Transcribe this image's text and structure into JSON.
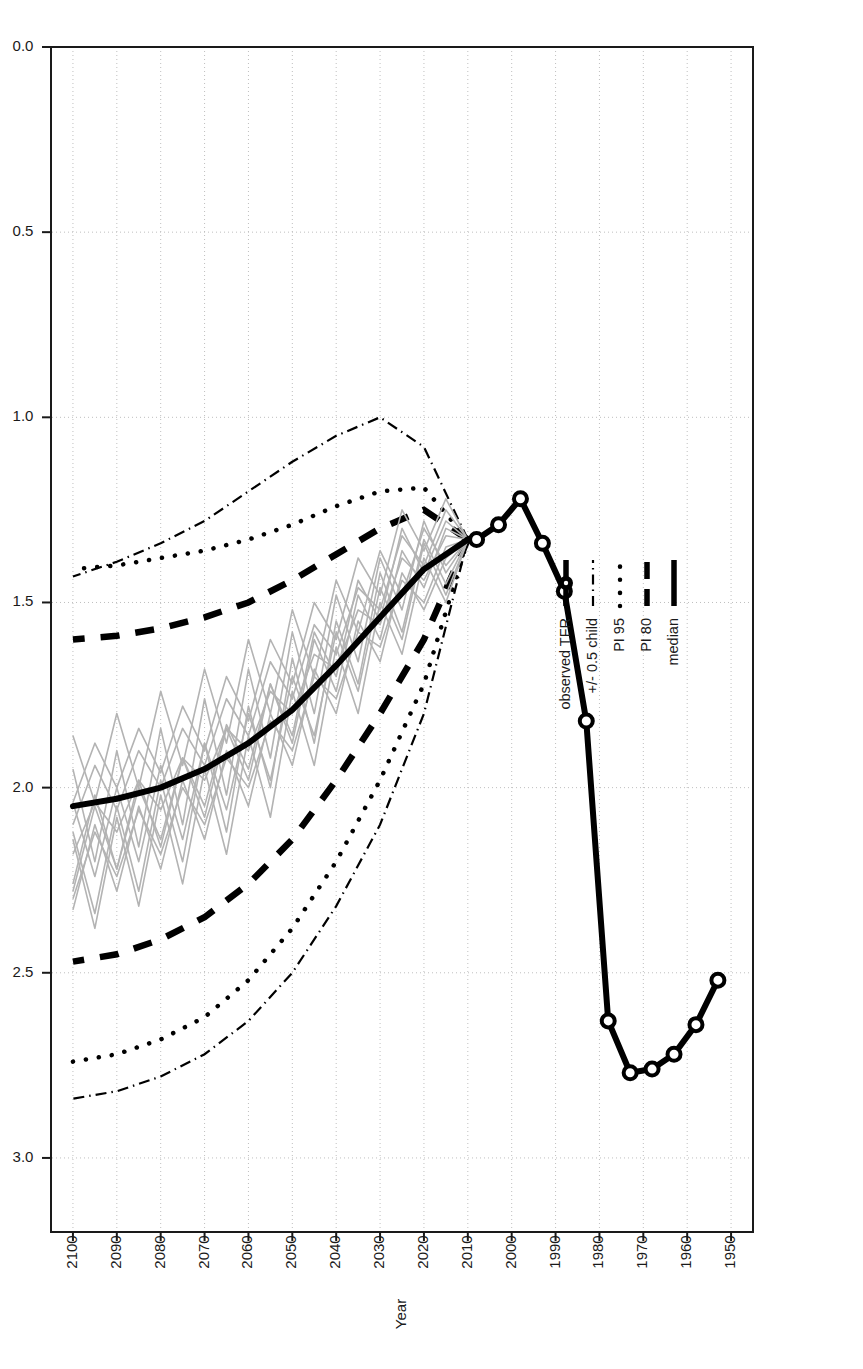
{
  "chart_data": {
    "type": "line",
    "title": "",
    "xlabel": "Year",
    "ylabel": "TFR",
    "xlim": [
      1945,
      2105
    ],
    "ylim": [
      0.0,
      3.2
    ],
    "xticks": [
      1950,
      1960,
      1970,
      1980,
      1990,
      2000,
      2010,
      2020,
      2030,
      2040,
      2050,
      2060,
      2070,
      2080,
      2090,
      2100
    ],
    "yticks": [
      "0.0",
      "0.5",
      "1.0",
      "1.5",
      "2.0",
      "2.5",
      "3.0"
    ],
    "grid": true,
    "legend_position": "bottom-left",
    "legend": [
      {
        "label": "median",
        "style": "solid-thick"
      },
      {
        "label": "PI 80",
        "style": "dashed-thick"
      },
      {
        "label": "PI 95",
        "style": "dotted"
      },
      {
        "label": "+/- 0.5 child",
        "style": "dash-dot"
      },
      {
        "label": "observed TFR",
        "style": "line-with-open-circles"
      }
    ],
    "series": [
      {
        "name": "observed TFR",
        "x": [
          1953,
          1958,
          1963,
          1968,
          1973,
          1978,
          1983,
          1988,
          1993,
          1998,
          2003,
          2008
        ],
        "values": [
          2.52,
          2.64,
          2.72,
          2.76,
          2.77,
          2.63,
          1.82,
          1.47,
          1.34,
          1.22,
          1.29,
          1.33
        ]
      },
      {
        "name": "median",
        "x": [
          2010,
          2020,
          2030,
          2040,
          2050,
          2060,
          2070,
          2080,
          2090,
          2100
        ],
        "values": [
          1.33,
          1.41,
          1.54,
          1.67,
          1.79,
          1.88,
          1.95,
          2.0,
          2.03,
          2.05
        ]
      },
      {
        "name": "PI 80 lower",
        "x": [
          2010,
          2020,
          2030,
          2040,
          2050,
          2060,
          2070,
          2080,
          2090,
          2100
        ],
        "values": [
          1.33,
          1.25,
          1.3,
          1.37,
          1.44,
          1.5,
          1.54,
          1.57,
          1.59,
          1.6
        ]
      },
      {
        "name": "PI 80 upper",
        "x": [
          2010,
          2020,
          2030,
          2040,
          2050,
          2060,
          2070,
          2080,
          2090,
          2100
        ],
        "values": [
          1.33,
          1.6,
          1.8,
          1.98,
          2.14,
          2.26,
          2.35,
          2.41,
          2.45,
          2.47
        ]
      },
      {
        "name": "PI 95 lower",
        "x": [
          2010,
          2020,
          2030,
          2040,
          2050,
          2060,
          2070,
          2080,
          2090,
          2100
        ],
        "values": [
          1.33,
          1.19,
          1.2,
          1.24,
          1.29,
          1.33,
          1.36,
          1.38,
          1.4,
          1.41
        ]
      },
      {
        "name": "PI 95 upper",
        "x": [
          2010,
          2020,
          2030,
          2040,
          2050,
          2060,
          2070,
          2080,
          2090,
          2100
        ],
        "values": [
          1.33,
          1.72,
          1.98,
          2.2,
          2.38,
          2.52,
          2.62,
          2.68,
          2.72,
          2.74
        ]
      },
      {
        "name": "+/- 0.5 child lower",
        "x": [
          2010,
          2020,
          2030,
          2040,
          2050,
          2060,
          2070,
          2080,
          2090,
          2100
        ],
        "values": [
          1.33,
          1.08,
          1.0,
          1.05,
          1.12,
          1.2,
          1.28,
          1.34,
          1.39,
          1.43
        ]
      },
      {
        "name": "+/- 0.5 child upper",
        "x": [
          2010,
          2020,
          2030,
          2040,
          2050,
          2060,
          2070,
          2080,
          2090,
          2100
        ],
        "values": [
          1.33,
          1.8,
          2.1,
          2.32,
          2.5,
          2.63,
          2.72,
          2.78,
          2.82,
          2.84
        ]
      }
    ],
    "trajectories": [
      {
        "name": "traj-1",
        "x": [
          2010,
          2015,
          2020,
          2025,
          2030,
          2035,
          2040,
          2045,
          2050,
          2055,
          2060,
          2065,
          2070,
          2075,
          2080,
          2085,
          2090,
          2095,
          2100
        ],
        "values": [
          1.33,
          1.28,
          1.42,
          1.3,
          1.55,
          1.44,
          1.7,
          1.58,
          1.86,
          1.72,
          1.95,
          1.83,
          2.05,
          1.92,
          2.14,
          2.0,
          2.22,
          2.05,
          2.28
        ]
      },
      {
        "name": "traj-2",
        "x": [
          2010,
          2015,
          2020,
          2025,
          2030,
          2035,
          2040,
          2045,
          2050,
          2055,
          2060,
          2065,
          2070,
          2075,
          2080,
          2085,
          2090,
          2095,
          2100
        ],
        "values": [
          1.33,
          1.45,
          1.33,
          1.58,
          1.42,
          1.72,
          1.55,
          1.88,
          1.65,
          2.0,
          1.78,
          2.12,
          1.88,
          2.2,
          1.98,
          2.28,
          2.05,
          2.34,
          2.12
        ]
      },
      {
        "name": "traj-3",
        "x": [
          2010,
          2015,
          2020,
          2025,
          2030,
          2035,
          2040,
          2045,
          2050,
          2055,
          2060,
          2065,
          2070,
          2075,
          2080,
          2085,
          2090,
          2095,
          2100
        ],
        "values": [
          1.33,
          1.38,
          1.52,
          1.42,
          1.66,
          1.55,
          1.8,
          1.68,
          1.94,
          1.8,
          2.05,
          1.9,
          2.14,
          1.98,
          2.22,
          2.05,
          2.28,
          2.1,
          2.33
        ]
      },
      {
        "name": "traj-4",
        "x": [
          2010,
          2015,
          2020,
          2025,
          2030,
          2035,
          2040,
          2045,
          2050,
          2055,
          2060,
          2065,
          2070,
          2075,
          2080,
          2085,
          2090,
          2095,
          2100
        ],
        "values": [
          1.33,
          1.22,
          1.36,
          1.25,
          1.48,
          1.38,
          1.6,
          1.5,
          1.72,
          1.6,
          1.82,
          1.7,
          1.9,
          1.78,
          1.96,
          1.84,
          2.0,
          1.88,
          2.04
        ]
      },
      {
        "name": "traj-5",
        "x": [
          2010,
          2015,
          2020,
          2025,
          2030,
          2035,
          2040,
          2045,
          2050,
          2055,
          2060,
          2065,
          2070,
          2075,
          2080,
          2085,
          2090,
          2095,
          2100
        ],
        "values": [
          1.33,
          1.5,
          1.38,
          1.64,
          1.5,
          1.8,
          1.62,
          1.94,
          1.74,
          2.08,
          1.86,
          2.18,
          1.95,
          2.26,
          2.02,
          2.32,
          2.08,
          2.38,
          2.14
        ]
      },
      {
        "name": "traj-6",
        "x": [
          2010,
          2015,
          2020,
          2025,
          2030,
          2035,
          2040,
          2045,
          2050,
          2055,
          2060,
          2065,
          2070,
          2075,
          2080,
          2085,
          2090,
          2095,
          2100
        ],
        "values": [
          1.33,
          1.3,
          1.46,
          1.36,
          1.6,
          1.48,
          1.74,
          1.6,
          1.88,
          1.72,
          1.98,
          1.84,
          2.08,
          1.92,
          2.16,
          1.98,
          2.22,
          2.02,
          2.26
        ]
      },
      {
        "name": "traj-7",
        "x": [
          2010,
          2015,
          2020,
          2025,
          2030,
          2035,
          2040,
          2045,
          2050,
          2055,
          2060,
          2065,
          2070,
          2075,
          2080,
          2085,
          2090,
          2095,
          2100
        ],
        "values": [
          1.33,
          1.42,
          1.28,
          1.52,
          1.38,
          1.66,
          1.48,
          1.8,
          1.58,
          1.92,
          1.68,
          2.02,
          1.76,
          2.1,
          1.84,
          2.16,
          1.9,
          2.2,
          1.95
        ]
      },
      {
        "name": "traj-8",
        "x": [
          2010,
          2015,
          2020,
          2025,
          2030,
          2035,
          2040,
          2045,
          2050,
          2055,
          2060,
          2065,
          2070,
          2075,
          2080,
          2085,
          2090,
          2095,
          2100
        ],
        "values": [
          1.33,
          1.35,
          1.5,
          1.44,
          1.62,
          1.58,
          1.76,
          1.7,
          1.9,
          1.82,
          2.0,
          1.92,
          2.1,
          2.0,
          2.18,
          2.06,
          2.24,
          2.12,
          2.3
        ]
      },
      {
        "name": "traj-9",
        "x": [
          2010,
          2015,
          2020,
          2025,
          2030,
          2035,
          2040,
          2045,
          2050,
          2055,
          2060,
          2065,
          2070,
          2075,
          2080,
          2085,
          2090,
          2095,
          2100
        ],
        "values": [
          1.33,
          1.25,
          1.4,
          1.32,
          1.52,
          1.46,
          1.64,
          1.56,
          1.76,
          1.66,
          1.86,
          1.76,
          1.94,
          1.84,
          2.0,
          1.9,
          2.06,
          1.94,
          2.1
        ]
      },
      {
        "name": "traj-10",
        "x": [
          2010,
          2015,
          2020,
          2025,
          2030,
          2035,
          2040,
          2045,
          2050,
          2055,
          2060,
          2065,
          2070,
          2075,
          2080,
          2085,
          2090,
          2095,
          2100
        ],
        "values": [
          1.33,
          1.48,
          1.34,
          1.6,
          1.46,
          1.74,
          1.58,
          1.86,
          1.7,
          1.98,
          1.8,
          2.06,
          1.88,
          2.14,
          1.94,
          2.2,
          2.0,
          2.24,
          2.04
        ]
      },
      {
        "name": "traj-11",
        "x": [
          2010,
          2015,
          2020,
          2025,
          2030,
          2035,
          2040,
          2045,
          2050,
          2055,
          2060,
          2065,
          2070,
          2075,
          2080,
          2085,
          2090,
          2095,
          2100
        ],
        "values": [
          1.33,
          1.32,
          1.44,
          1.38,
          1.56,
          1.52,
          1.68,
          1.64,
          1.8,
          1.74,
          1.9,
          1.84,
          1.98,
          1.92,
          2.06,
          1.98,
          2.12,
          2.04,
          2.18
        ]
      },
      {
        "name": "traj-12",
        "x": [
          2010,
          2015,
          2020,
          2025,
          2030,
          2035,
          2040,
          2045,
          2050,
          2055,
          2060,
          2065,
          2070,
          2075,
          2080,
          2085,
          2090,
          2095,
          2100
        ],
        "values": [
          1.33,
          1.4,
          1.3,
          1.48,
          1.36,
          1.58,
          1.44,
          1.7,
          1.52,
          1.8,
          1.6,
          1.88,
          1.68,
          1.94,
          1.74,
          2.0,
          1.8,
          2.04,
          1.86
        ]
      }
    ]
  },
  "axes": {
    "x_label": "Year",
    "y_label": "TFR",
    "x_tick_labels": [
      "1950",
      "1960",
      "1970",
      "1980",
      "1990",
      "2000",
      "2010",
      "2020",
      "2030",
      "2040",
      "2050",
      "2060",
      "2070",
      "2080",
      "2090",
      "2100"
    ],
    "y_tick_labels": [
      "0.0",
      "0.5",
      "1.0",
      "1.5",
      "2.0",
      "2.5",
      "3.0"
    ]
  },
  "legend": {
    "items": [
      {
        "label": "median"
      },
      {
        "label": "PI 80"
      },
      {
        "label": "PI 95"
      },
      {
        "label": "+/- 0.5 child"
      },
      {
        "label": "observed TFR"
      }
    ]
  },
  "colors": {
    "foreground": "#000000",
    "grid": "#bfbfbf",
    "trajectory": "#b3b3b3",
    "background": "#ffffff",
    "frame": "#1a1a1a"
  }
}
